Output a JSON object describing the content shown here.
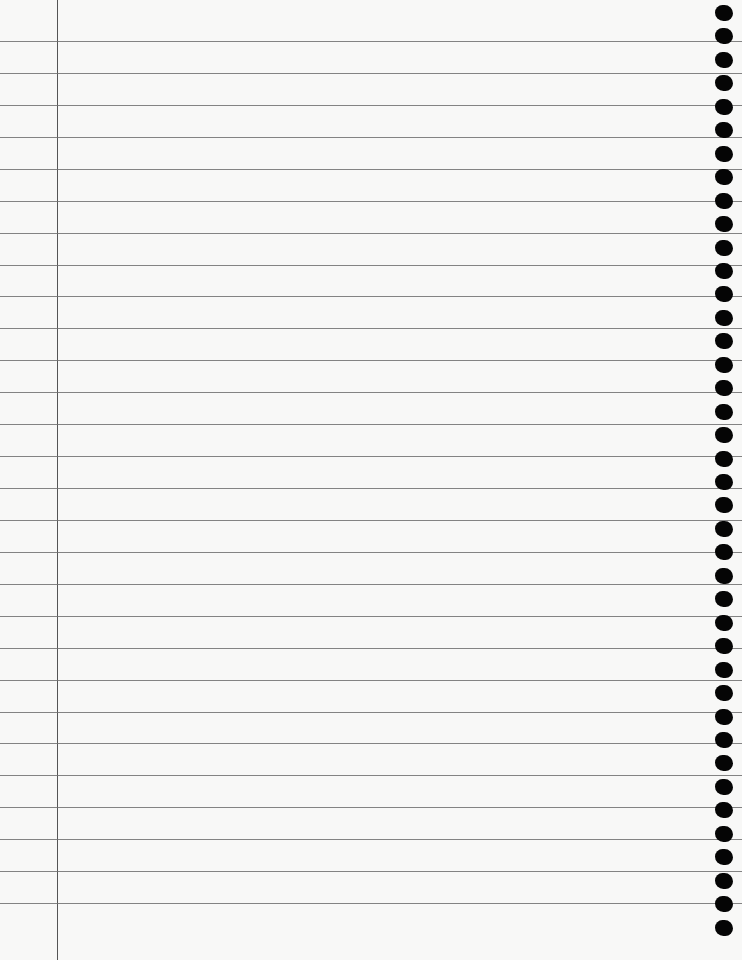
{
  "page": {
    "type": "lined notebook paper",
    "background": "#f8f8f7",
    "line_color": "#6e6e6e",
    "margin_color": "#555555",
    "margin_x": 57,
    "first_line_y": 41,
    "line_spacing": 31.93,
    "line_count": 28,
    "hole_first_y": 5,
    "hole_spacing": 23.45,
    "hole_count": 40,
    "hole_color": "#050505"
  }
}
